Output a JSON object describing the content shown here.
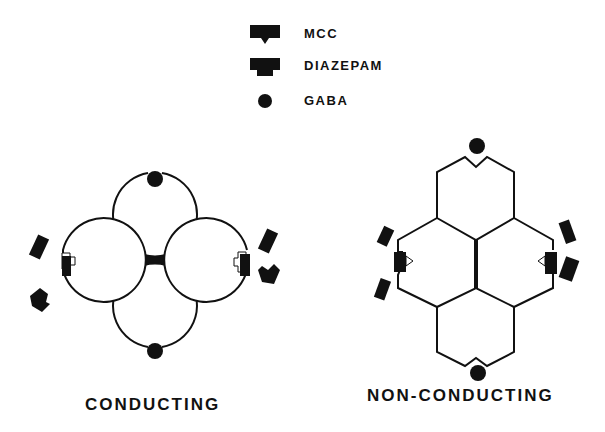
{
  "legend": {
    "items": [
      {
        "label": "MCC",
        "icon": "mcc-shape-icon"
      },
      {
        "label": "DIAZEPAM",
        "icon": "diazepam-shape-icon"
      },
      {
        "label": "GABA",
        "icon": "gaba-circle-icon"
      }
    ]
  },
  "panels": {
    "left": {
      "caption": "CONDUCTING"
    },
    "right": {
      "caption": "NON-CONDUCTING"
    }
  },
  "colors": {
    "ink": "#111111",
    "background": "#ffffff"
  }
}
